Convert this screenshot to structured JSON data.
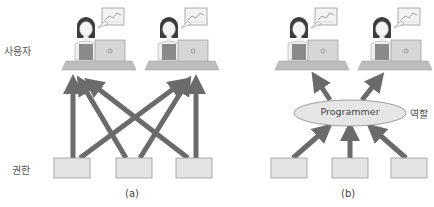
{
  "labels": {
    "users": "사용자",
    "permissions": "권한",
    "role": "역할"
  },
  "panels": [
    {
      "caption": "(a)"
    },
    {
      "caption": "(b)",
      "role_name": "Programmer"
    }
  ],
  "colors": {
    "arrow": "#6b6b6b",
    "box_fill": "#e4e4e4",
    "box_stroke": "#9a9a9a",
    "ellipse_fill": "#e6e6e6",
    "ellipse_stroke": "#8a8a8a",
    "desk": "#bdbdbd",
    "shirt": "#8a8a8a",
    "laptop": "#d6d6d6"
  }
}
